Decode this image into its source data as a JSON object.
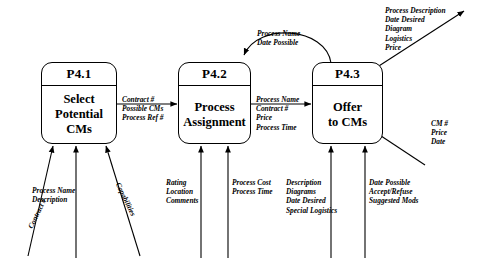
{
  "diagram": {
    "type": "data-flow-diagram",
    "processes": [
      {
        "id": "P4.1",
        "name_line1": "Select",
        "name_line2": "Potential",
        "name_line3": "CMs"
      },
      {
        "id": "P4.2",
        "name_line1": "Process",
        "name_line2": "Assignment",
        "name_line3": ""
      },
      {
        "id": "P4.3",
        "name_line1": "Offer",
        "name_line2": "to CMs",
        "name_line3": ""
      }
    ],
    "flows": {
      "p41_to_p42": {
        "line1": "Contract #",
        "line2": "Possible CMs",
        "line3": "Process Ref #"
      },
      "p42_to_p43": {
        "line1": "Process  Name",
        "line2": "Contract #",
        "line3": "Price",
        "line4": "Process Time"
      },
      "p43_to_p42_feedback": {
        "line1": "Process Name",
        "line2": "Date Possible"
      },
      "p43_out_upper": {
        "line1": "Process Description",
        "line2": "Date Desired",
        "line3": "Diagram",
        "line4": "Logistics",
        "line5": "Price"
      },
      "p43_out_lower": {
        "line1": "CM #",
        "line2": "Price",
        "line3": "Date"
      },
      "p41_in_left": {
        "line1": "Contract #"
      },
      "p41_in_center": {
        "line1": "Process Name",
        "line2": "Description"
      },
      "p41_in_right": {
        "line1": "Capabilities"
      },
      "p42_in_left": {
        "line1": "Rating",
        "line2": "Location",
        "line3": "Comments"
      },
      "p42_in_right": {
        "line1": "Process Cost",
        "line2": "Process Time"
      },
      "p43_in_left": {
        "line1": "Description",
        "line2": "Diagrams",
        "line3": "Date Desired",
        "line4": "Special Logistics"
      },
      "p43_in_right": {
        "line1": "Date Possible",
        "line2": "Accept/Refuse",
        "line3": "Suggested Mods"
      }
    },
    "colors": {
      "stroke": "#000000",
      "background": "#ffffff"
    }
  }
}
